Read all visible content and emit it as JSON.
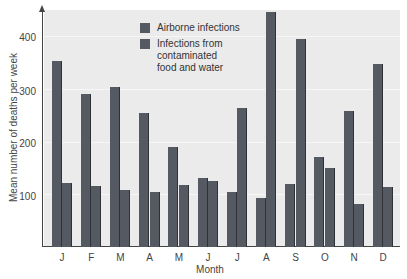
{
  "chart_data": {
    "type": "bar",
    "title": "",
    "xlabel": "Month",
    "ylabel": "Mean number of deaths per week",
    "ylim": [
      0,
      450
    ],
    "yticks": [
      100,
      200,
      300,
      400
    ],
    "grid": true,
    "legend_position": "top-center",
    "categories": [
      "J",
      "F",
      "M",
      "A",
      "M",
      "J",
      "J",
      "A",
      "S",
      "O",
      "N",
      "D"
    ],
    "series": [
      {
        "name": "Airborne infections",
        "color": "#555a62",
        "values": [
          352,
          290,
          303,
          255,
          189,
          131,
          105,
          93,
          120,
          170,
          259,
          347
        ]
      },
      {
        "name": "Infections from contaminated food and water",
        "color": "#555a62",
        "values": [
          122,
          116,
          109,
          105,
          118,
          126,
          263,
          446,
          394,
          150,
          82,
          114
        ]
      }
    ]
  },
  "legend": {
    "items": [
      {
        "label": "Airborne infections"
      },
      {
        "label": "Infections from\ncontaminated\nfood and water"
      }
    ]
  },
  "axes": {
    "xlabel": "Month",
    "ylabel": "Mean number of deaths per week",
    "yticks": [
      "100",
      "200",
      "300",
      "400"
    ]
  }
}
